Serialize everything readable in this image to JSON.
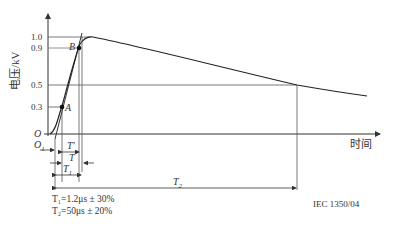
{
  "diagram": {
    "y_axis_label": "电压/kV",
    "x_axis_label": "时间",
    "y_ticks": [
      "1.0",
      "0.9",
      "0.5",
      "0.3"
    ],
    "points": {
      "A": "A",
      "B": "B",
      "O": "O",
      "O1": "O",
      "O1_sub": "1"
    },
    "intervals": {
      "T_prime": "T′",
      "T": "T",
      "T1": "T",
      "T1_sub": "1",
      "T2": "T",
      "T2_sub": "2"
    },
    "formula_1": "T₁=1.2μs ± 30%",
    "formula_2": "T₂=50μs ± 20%",
    "reference": "IEC 1350/04"
  }
}
